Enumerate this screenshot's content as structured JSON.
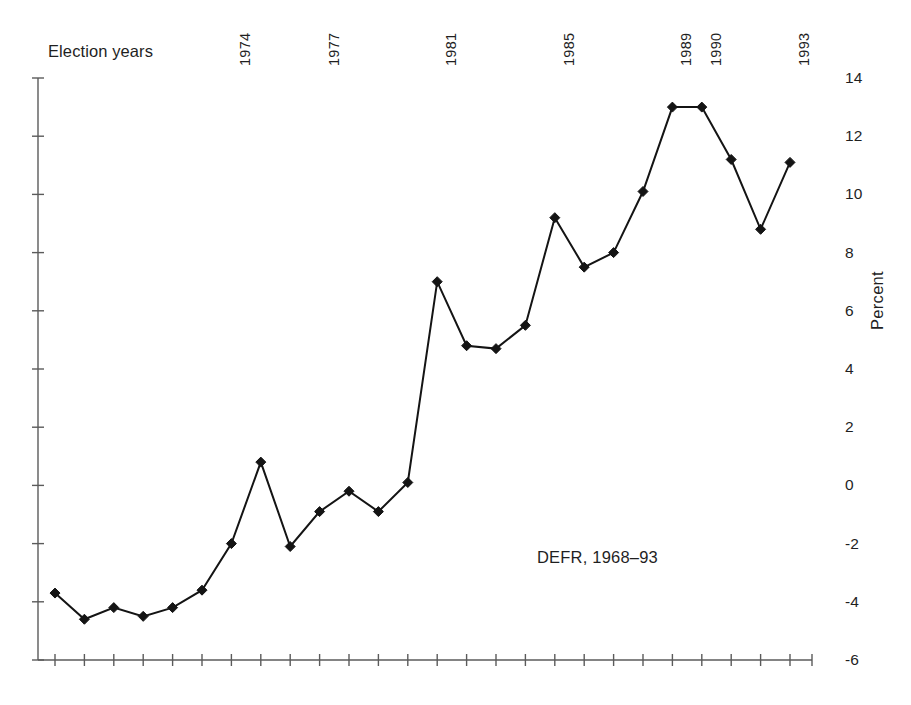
{
  "labels": {
    "election_years": "Election years",
    "y_axis_title": "Percent",
    "annotation": "DEFR, 1968–93"
  },
  "chart_data": {
    "type": "line",
    "title": "",
    "subtitle": "",
    "xlabel": "",
    "ylabel": "Percent",
    "annotations": [
      "DEFR, 1968–93",
      "Election years"
    ],
    "grid": false,
    "legend": "none",
    "ylim": [
      -6,
      14
    ],
    "ytick_step": 2,
    "ytick_labels": [
      "14",
      "12",
      "10",
      "8",
      "6",
      "4",
      "2",
      "0",
      "-2",
      "-4",
      "-6"
    ],
    "ytick_values": [
      14,
      12,
      10,
      8,
      6,
      4,
      2,
      0,
      -2,
      -4,
      -6
    ],
    "xlim": [
      1968,
      1993
    ],
    "x": [
      1968,
      1969,
      1970,
      1971,
      1972,
      1973,
      1974,
      1975,
      1976,
      1977,
      1978,
      1979,
      1980,
      1981,
      1982,
      1983,
      1984,
      1985,
      1986,
      1987,
      1988,
      1989,
      1990,
      1991,
      1992,
      1993
    ],
    "values": [
      -3.7,
      -4.6,
      -4.2,
      -4.5,
      -4.2,
      -3.6,
      -2.0,
      0.8,
      -2.1,
      -0.9,
      -0.2,
      -0.9,
      0.1,
      7.0,
      4.8,
      4.7,
      5.5,
      9.2,
      7.5,
      8.0,
      10.1,
      13.0,
      13.0,
      11.2,
      8.8,
      11.1
    ],
    "series": [
      {
        "name": "DEFR, 1968–93",
        "values": [
          -3.7,
          -4.6,
          -4.2,
          -4.5,
          -4.2,
          -3.6,
          -2.0,
          0.8,
          -2.1,
          -0.9,
          -0.2,
          -0.9,
          0.1,
          7.0,
          4.8,
          4.7,
          5.5,
          9.2,
          7.5,
          8.0,
          10.1,
          13.0,
          13.0,
          11.2,
          8.8,
          11.1
        ]
      }
    ],
    "election_year_labels": [
      "1974",
      "1977",
      "1981",
      "1985",
      "1989",
      "1990",
      "1993"
    ],
    "election_years": [
      1974,
      1977,
      1981,
      1985,
      1989,
      1990,
      1993
    ],
    "marker": "diamond",
    "line_color": "#141414",
    "axis_color": "#5b5b5b"
  },
  "year_labels": [
    {
      "text": "1974",
      "year": 1974
    },
    {
      "text": "1977",
      "year": 1977
    },
    {
      "text": "1981",
      "year": 1981
    },
    {
      "text": "1985",
      "year": 1985
    },
    {
      "text": "1989",
      "year": 1989
    },
    {
      "text": "1990",
      "year": 1990
    },
    {
      "text": "1993",
      "year": 1993
    }
  ],
  "y_labels": [
    {
      "text": "14",
      "value": 14
    },
    {
      "text": "12",
      "value": 12
    },
    {
      "text": "10",
      "value": 10
    },
    {
      "text": "8",
      "value": 8
    },
    {
      "text": "6",
      "value": 6
    },
    {
      "text": "4",
      "value": 4
    },
    {
      "text": "2",
      "value": 2
    },
    {
      "text": "0",
      "value": 0
    },
    {
      "text": "-2",
      "value": -2
    },
    {
      "text": "-4",
      "value": -4
    },
    {
      "text": "-6",
      "value": -6
    }
  ]
}
